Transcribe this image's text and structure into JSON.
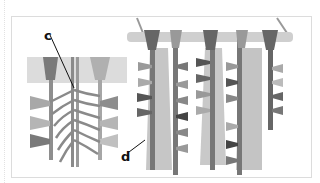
{
  "figure": {
    "labels": [
      {
        "id": "c",
        "text": "c",
        "x": 44,
        "y": 29
      },
      {
        "id": "d",
        "text": "d",
        "x": 124,
        "y": 152
      }
    ],
    "colors": {
      "band": "#d8d8d8",
      "dark": "#555555",
      "mid": "#8a8a8a",
      "light": "#b8b8b8",
      "fringe": "#c4c4c4",
      "stick": "#c9c9c9"
    }
  }
}
